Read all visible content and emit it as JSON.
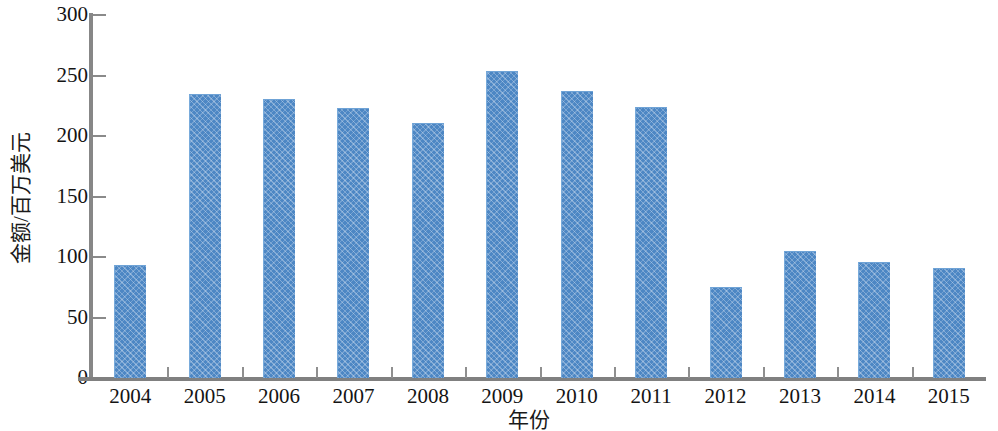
{
  "chart_data": {
    "type": "bar",
    "title": "",
    "subtitle": "",
    "xlabel": "年份",
    "ylabel": "金额/百万美元",
    "categories": [
      "2004",
      "2005",
      "2006",
      "2007",
      "2008",
      "2009",
      "2010",
      "2011",
      "2012",
      "2013",
      "2014",
      "2015"
    ],
    "values": [
      93,
      235,
      231,
      223,
      211,
      254,
      237,
      224,
      75,
      105,
      96,
      91
    ],
    "series": [
      {
        "name": "金额",
        "values": [
          93,
          235,
          231,
          223,
          211,
          254,
          237,
          224,
          75,
          105,
          96,
          91
        ]
      }
    ],
    "ylim": [
      0,
      300
    ],
    "ytick_step": 50,
    "ytick_labels": [
      "0",
      "50",
      "100",
      "150",
      "200",
      "250",
      "300"
    ],
    "ytick_values": [
      0,
      50,
      100,
      150,
      200,
      250,
      300
    ],
    "grid": false,
    "legend": null,
    "legend_position": "none",
    "annotations": [],
    "colors": {
      "bar_fill": "#4d87c4",
      "bar_hatch": "#79abdb",
      "axis": "#808080",
      "text": "#141414",
      "background": "#ffffff"
    }
  }
}
